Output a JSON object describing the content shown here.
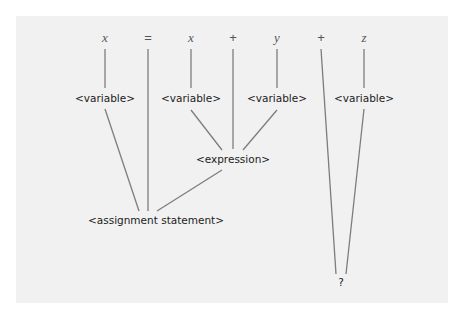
{
  "tokens": [
    "x",
    "=",
    "x",
    "+",
    "y",
    "+",
    "z"
  ],
  "nodes": {
    "var1": "<variable>",
    "var2": "<variable>",
    "var3": "<variable>",
    "var4": "<variable>",
    "expression": "<expression>",
    "assignment": "<assignment statement>",
    "unknown": "?"
  },
  "colors": {
    "panel": "#f1f1f1",
    "line": "#7d7d7d",
    "text": "#222222",
    "token": "#555555"
  }
}
